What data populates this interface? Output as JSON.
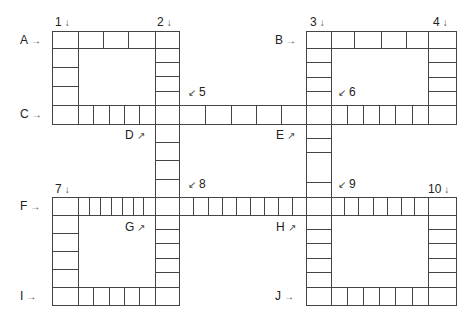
{
  "puzzle": {
    "type": "crossword-grid",
    "line_color": "#444444",
    "across_labels": [
      {
        "id": "A",
        "text": "A",
        "arrow": "→",
        "x": 20,
        "y": 34
      },
      {
        "id": "B",
        "text": "B",
        "arrow": "→",
        "x": 275,
        "y": 34
      },
      {
        "id": "C",
        "text": "C",
        "arrow": "→",
        "x": 20,
        "y": 108
      },
      {
        "id": "F",
        "text": "F",
        "arrow": "→",
        "x": 20,
        "y": 200
      },
      {
        "id": "I",
        "text": "I",
        "arrow": "→",
        "x": 20,
        "y": 290
      },
      {
        "id": "J",
        "text": "J",
        "arrow": "→",
        "x": 275,
        "y": 290
      }
    ],
    "down_labels": [
      {
        "id": "1",
        "text": "1",
        "arrow": "↓",
        "x": 55,
        "y": 16
      },
      {
        "id": "2",
        "text": "2",
        "arrow": "↓",
        "x": 157,
        "y": 16
      },
      {
        "id": "3",
        "text": "3",
        "arrow": "↓",
        "x": 310,
        "y": 16
      },
      {
        "id": "4",
        "text": "4",
        "arrow": "↓",
        "x": 433,
        "y": 16
      },
      {
        "id": "7",
        "text": "7",
        "arrow": "↓",
        "x": 55,
        "y": 183
      },
      {
        "id": "10",
        "text": "10",
        "arrow": "↓",
        "x": 428,
        "y": 183
      }
    ],
    "diagonal_labels": [
      {
        "id": "5",
        "text": "5",
        "arrow": "↙",
        "arrow_first": true,
        "x": 188,
        "y": 86
      },
      {
        "id": "6",
        "text": "6",
        "arrow": "↙",
        "arrow_first": true,
        "x": 338,
        "y": 86
      },
      {
        "id": "8",
        "text": "8",
        "arrow": "↙",
        "arrow_first": true,
        "x": 188,
        "y": 178
      },
      {
        "id": "9",
        "text": "9",
        "arrow": "↙",
        "arrow_first": true,
        "x": 338,
        "y": 178
      },
      {
        "id": "D",
        "text": "D",
        "arrow": "↗",
        "arrow_first": false,
        "x": 125,
        "y": 129
      },
      {
        "id": "E",
        "text": "E",
        "arrow": "↗",
        "arrow_first": false,
        "x": 276,
        "y": 129
      },
      {
        "id": "G",
        "text": "G",
        "arrow": "↗",
        "arrow_first": false,
        "x": 125,
        "y": 221
      },
      {
        "id": "H",
        "text": "H",
        "arrow": "↗",
        "arrow_first": false,
        "x": 276,
        "y": 221
      }
    ],
    "rows": [
      {
        "id": "A",
        "y1": 31,
        "y2": 48,
        "xs": [
          52,
          78,
          103,
          128,
          155,
          179
        ]
      },
      {
        "id": "B",
        "y1": 31,
        "y2": 48,
        "xs": [
          306,
          331,
          354,
          381,
          406,
          428,
          456
        ]
      },
      {
        "id": "C",
        "y1": 105,
        "y2": 124,
        "xs": [
          52,
          78,
          93,
          109,
          124,
          139,
          155,
          179,
          205,
          231,
          256,
          281,
          306,
          331,
          347,
          363,
          379,
          395,
          412,
          428,
          456
        ]
      },
      {
        "id": "F",
        "y1": 197,
        "y2": 215,
        "xs": [
          52,
          78,
          89,
          100,
          111,
          122,
          133,
          143,
          155,
          179,
          193,
          208,
          222,
          236,
          250,
          264,
          278,
          292,
          306,
          331,
          344,
          358,
          373,
          387,
          401,
          414,
          428,
          456
        ]
      },
      {
        "id": "I",
        "y1": 287,
        "y2": 305,
        "xs": [
          52,
          78,
          93,
          109,
          124,
          139,
          155,
          179
        ]
      },
      {
        "id": "J",
        "y1": 287,
        "y2": 305,
        "xs": [
          306,
          331,
          347,
          363,
          379,
          395,
          412,
          428,
          456
        ]
      }
    ],
    "cols": [
      {
        "id": "1",
        "x1": 52,
        "x2": 78,
        "ys": [
          48,
          67,
          86,
          105
        ]
      },
      {
        "id": "2",
        "x1": 155,
        "x2": 179,
        "ys": [
          48,
          62,
          76,
          91,
          105
        ]
      },
      {
        "id": "3",
        "x1": 306,
        "x2": 331,
        "ys": [
          48,
          62,
          77,
          91,
          105
        ]
      },
      {
        "id": "4",
        "x1": 428,
        "x2": 456,
        "ys": [
          48,
          62,
          77,
          91,
          105
        ]
      },
      {
        "id": "D",
        "x1": 155,
        "x2": 179,
        "ys": [
          124,
          142,
          160,
          179,
          197
        ]
      },
      {
        "id": "E",
        "x1": 306,
        "x2": 331,
        "ys": [
          124,
          138,
          152,
          182,
          197
        ]
      },
      {
        "id": "7",
        "x1": 52,
        "x2": 78,
        "ys": [
          215,
          233,
          251,
          269,
          287
        ]
      },
      {
        "id": "G",
        "x1": 155,
        "x2": 179,
        "ys": [
          215,
          229,
          243,
          258,
          272,
          287
        ]
      },
      {
        "id": "H",
        "x1": 306,
        "x2": 331,
        "ys": [
          215,
          229,
          243,
          258,
          272,
          287
        ]
      },
      {
        "id": "10",
        "x1": 428,
        "x2": 456,
        "ys": [
          215,
          229,
          243,
          258,
          272,
          287
        ]
      }
    ]
  }
}
